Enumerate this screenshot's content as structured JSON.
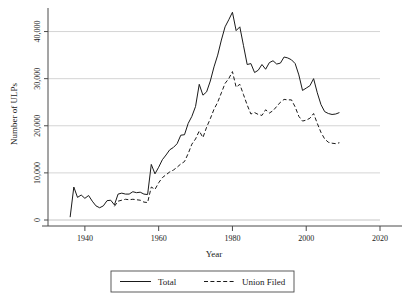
{
  "chart_data": {
    "type": "line",
    "title": "",
    "xlabel": "Year",
    "ylabel": "Number of ULPs",
    "xlim": [
      1930,
      2020
    ],
    "ylim": [
      0,
      45000
    ],
    "grid": "horizontal",
    "legend_position": "bottom-center",
    "xticks": [
      "1940",
      "1960",
      "1980",
      "2000",
      "2020"
    ],
    "xtick_values": [
      1940,
      1960,
      1980,
      2000,
      2020
    ],
    "yticks": [
      "0",
      "10,000",
      "20,000",
      "30,000",
      "40,000"
    ],
    "ytick_values": [
      0,
      10000,
      20000,
      30000,
      40000
    ],
    "series": [
      {
        "name": "Total",
        "style": "solid",
        "color": "#1a1a1a",
        "x": [
          1936,
          1937,
          1938,
          1939,
          1940,
          1941,
          1942,
          1943,
          1944,
          1945,
          1946,
          1947,
          1948,
          1949,
          1950,
          1951,
          1952,
          1953,
          1954,
          1955,
          1956,
          1957,
          1958,
          1959,
          1960,
          1961,
          1962,
          1963,
          1964,
          1965,
          1966,
          1967,
          1968,
          1969,
          1970,
          1971,
          1972,
          1973,
          1974,
          1975,
          1976,
          1977,
          1978,
          1979,
          1980,
          1981,
          1982,
          1983,
          1984,
          1985,
          1986,
          1987,
          1988,
          1989,
          1990,
          1991,
          1992,
          1993,
          1994,
          1995,
          1996,
          1997,
          1998,
          1999,
          2000,
          2001,
          2002,
          2003,
          2004,
          2005,
          2006,
          2007,
          2008,
          2009
        ],
        "values": [
          600,
          7000,
          4800,
          5300,
          4600,
          5200,
          4000,
          3000,
          2600,
          3000,
          4100,
          4200,
          3200,
          5500,
          5700,
          5500,
          5500,
          6000,
          5800,
          5900,
          5500,
          5400,
          11800,
          9800,
          11200,
          12800,
          13800,
          14900,
          15400,
          16200,
          18000,
          18100,
          20500,
          22000,
          24100,
          28800,
          26500,
          27200,
          29500,
          32500,
          35000,
          38200,
          41000,
          42500,
          44100,
          40200,
          41000,
          37000,
          33000,
          33200,
          31300,
          31800,
          33000,
          32000,
          33400,
          33800,
          33100,
          33300,
          34600,
          34400,
          34000,
          33200,
          30800,
          27500,
          28000,
          28500,
          30000,
          27000,
          24500,
          23000,
          22600,
          22400,
          22500,
          22800
        ]
      },
      {
        "name": "Union Filed",
        "style": "dashed",
        "color": "#1a1a1a",
        "x": [
          1948,
          1949,
          1950,
          1951,
          1952,
          1953,
          1954,
          1955,
          1956,
          1957,
          1958,
          1959,
          1960,
          1961,
          1962,
          1963,
          1964,
          1965,
          1966,
          1967,
          1968,
          1969,
          1970,
          1971,
          1972,
          1973,
          1974,
          1975,
          1976,
          1977,
          1978,
          1979,
          1980,
          1981,
          1982,
          1983,
          1984,
          1985,
          1986,
          1987,
          1988,
          1989,
          1990,
          1991,
          1992,
          1993,
          1994,
          1995,
          1996,
          1997,
          1998,
          1999,
          2000,
          2001,
          2002,
          2003,
          2004,
          2005,
          2006,
          2007,
          2008,
          2009
        ],
        "values": [
          2900,
          4000,
          4200,
          4400,
          4300,
          4400,
          4300,
          4200,
          3800,
          3700,
          7000,
          6500,
          7900,
          9000,
          9600,
          10200,
          10600,
          11200,
          11900,
          12400,
          14100,
          16100,
          17200,
          18900,
          17500,
          19700,
          21500,
          23500,
          25000,
          27000,
          29000,
          30000,
          31500,
          28200,
          28800,
          26600,
          24400,
          22500,
          22800,
          22400,
          22200,
          23400,
          22700,
          23200,
          24100,
          25000,
          25600,
          25500,
          25500,
          24000,
          22000,
          21000,
          21200,
          21600,
          22600,
          20500,
          18600,
          17200,
          16500,
          16300,
          16200,
          16400
        ]
      }
    ]
  },
  "legend": {
    "entries": [
      {
        "label": "Total",
        "style": "solid"
      },
      {
        "label": "Union Filed",
        "style": "dashed"
      }
    ]
  }
}
